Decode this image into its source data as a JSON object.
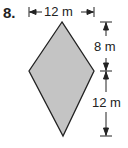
{
  "problem": {
    "number": "8."
  },
  "figure": {
    "shape": "kite",
    "fill": "#c4c4c4",
    "stroke": "#222222",
    "dimensions": {
      "width": "12 m",
      "upper_height": "8 m",
      "lower_height": "12 m"
    }
  }
}
